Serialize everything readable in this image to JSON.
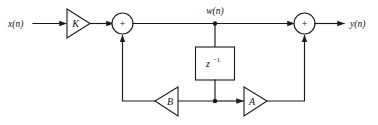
{
  "diagram": {
    "type": "signal-flow-block-diagram",
    "title": "",
    "background_color": "#ffffff",
    "line_color": "#1a1a1a",
    "signals": {
      "input": "x(n)",
      "intermediate": "w(n)",
      "output": "y(n)"
    },
    "blocks": {
      "gain_k": {
        "label": "K",
        "shape": "triangle",
        "direction": "right"
      },
      "gain_b": {
        "label": "B",
        "shape": "triangle",
        "direction": "left"
      },
      "gain_a": {
        "label": "A",
        "shape": "triangle",
        "direction": "right"
      },
      "delay": {
        "label": "z",
        "exponent": "−1",
        "shape": "rectangle"
      },
      "summer_left": {
        "label": "+",
        "shape": "circle"
      },
      "summer_right": {
        "label": "+",
        "shape": "circle"
      }
    }
  }
}
